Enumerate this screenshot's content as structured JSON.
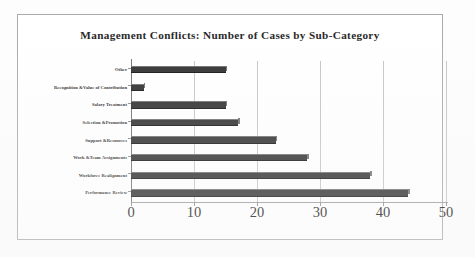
{
  "chart_data": {
    "type": "bar",
    "orientation": "horizontal",
    "title": "Management Conflicts: Number of Cases by Sub-Category",
    "xlabel": "",
    "ylabel": "",
    "xlim": [
      0,
      50
    ],
    "xticks": [
      "0",
      "10",
      "20",
      "30",
      "40",
      "50"
    ],
    "grid": true,
    "legend": false,
    "categories": [
      "Other",
      "Recognition &Value of Contribution",
      "Salary Treatment",
      "Selection &Promotion",
      "Support &Resources",
      "Work &Team Assignments",
      "Workforce Realignment",
      "Performance Review"
    ],
    "values": [
      15,
      2,
      15,
      17,
      23,
      28,
      38,
      44
    ],
    "bar_color": "#2b2b2b",
    "bar_highlight_color": "#6d6d6d",
    "gridline_color": "#c4c4c4",
    "axis_color": "#707070",
    "plot_background": "#ffffff",
    "border_color": "#a8a8a8"
  }
}
